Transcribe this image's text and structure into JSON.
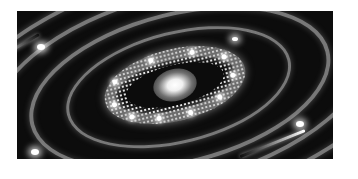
{
  "image": {
    "subject": "spiral galaxy with concentric elliptical rings",
    "palette": {
      "background": "#0c0c0c",
      "ring": "#d2d2d2",
      "core": "#ffffff",
      "page": "#ffffff"
    }
  }
}
